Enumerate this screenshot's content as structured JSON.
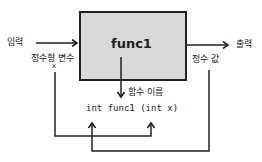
{
  "diagram": {
    "function_box": {
      "label": "func1",
      "fill": "#d9d9d9",
      "stroke": "#222222"
    },
    "input_label": "입력",
    "output_label": "출력",
    "param_type_label": "정수형 변수",
    "param_name_label": "x",
    "return_label": "정수 값",
    "func_name_label": "함수 이름",
    "signature": "int func1 (int x)"
  }
}
